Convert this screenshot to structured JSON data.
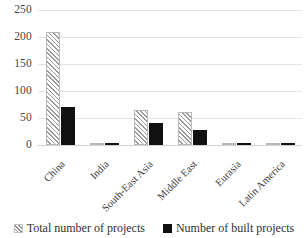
{
  "chart_data": {
    "type": "bar",
    "title": "",
    "subtitle": "",
    "xlabel": "",
    "ylabel": "",
    "ylim": [
      0,
      250
    ],
    "yticks": [
      0,
      50,
      100,
      150,
      200,
      250
    ],
    "grid": true,
    "legend_position": "bottom",
    "categories": [
      "China",
      "India",
      "South-East Asia",
      "Middle East",
      "Eurasia",
      "Latin America"
    ],
    "series": [
      {
        "name": "Total number of projects",
        "pattern": "diagonal-hatch",
        "color": "#ffffff",
        "hatch_color": "#9a9a9a",
        "values": [
          210,
          4,
          65,
          62,
          4,
          3
        ]
      },
      {
        "name": "Number of built projects",
        "pattern": "solid",
        "color": "#111111",
        "values": [
          70,
          3,
          40,
          27,
          2,
          2
        ]
      }
    ]
  },
  "axis": {
    "y_tick_labels": [
      "250",
      "200",
      "150",
      "100",
      "50",
      "0"
    ]
  },
  "legend": {
    "items": [
      {
        "label": "Total number of projects",
        "swatch": "hatched-swatch-icon"
      },
      {
        "label": "Number of built projects",
        "swatch": "solid-black-swatch-icon"
      }
    ]
  }
}
